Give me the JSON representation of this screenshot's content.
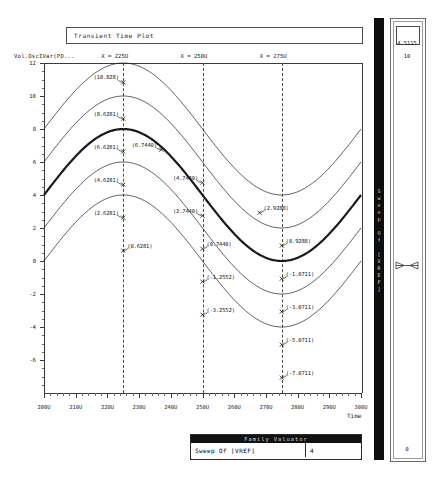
{
  "window": {
    "title": "Transient Time Plot"
  },
  "plot": {
    "y_axis_label": "Vol.OscIVar(PD...",
    "x_axis_label": "Time",
    "y_ticks": [
      "12",
      "10",
      "8",
      "6",
      "4",
      "2",
      "0",
      "-2",
      "-4",
      "-6"
    ],
    "y_values": [
      12,
      10,
      8,
      6,
      4,
      2,
      0,
      -2,
      -4,
      -6
    ],
    "x_ticks": [
      "200U",
      "210U",
      "220U",
      "230U",
      "240U",
      "250U",
      "260U",
      "270U",
      "280U",
      "290U",
      "300U"
    ],
    "x_values": [
      200,
      210,
      220,
      230,
      240,
      250,
      260,
      270,
      280,
      290,
      300
    ],
    "cursors": [
      {
        "label": "X = 225U",
        "x": 225
      },
      {
        "label": "X = 250U",
        "x": 250
      },
      {
        "label": "X = 275U",
        "x": 275
      }
    ],
    "annotations": [
      {
        "text": "(10.828)",
        "x": 225,
        "y": 10.828
      },
      {
        "text": "(8.6281)",
        "x": 225,
        "y": 8.6281
      },
      {
        "text": "(6.6281)",
        "x": 225,
        "y": 6.6281
      },
      {
        "text": "(6.7440)",
        "x": 237,
        "y": 6.744
      },
      {
        "text": "(4.6281)",
        "x": 225,
        "y": 4.6281
      },
      {
        "text": "(4.7440)",
        "x": 250,
        "y": 4.744
      },
      {
        "text": "(2.6281)",
        "x": 225,
        "y": 2.6281
      },
      {
        "text": "(2.7440)",
        "x": 250,
        "y": 2.744
      },
      {
        "text": "(2.9288)",
        "x": 268,
        "y": 2.9288
      },
      {
        "text": "(0.6281)",
        "x": 225,
        "y": 0.6281
      },
      {
        "text": "(0.7440)",
        "x": 250,
        "y": 0.744
      },
      {
        "text": "(0.9288)",
        "x": 275,
        "y": 0.9288
      },
      {
        "text": "(-1.2552)",
        "x": 250,
        "y": -1.2552
      },
      {
        "text": "(-1.0711)",
        "x": 275,
        "y": -1.0711
      },
      {
        "text": "(-3.2552)",
        "x": 250,
        "y": -3.2552
      },
      {
        "text": "(-3.0711)",
        "x": 275,
        "y": -3.0711
      },
      {
        "text": "(-5.0711)",
        "x": 275,
        "y": -5.0711
      },
      {
        "text": "(-7.0711)",
        "x": 275,
        "y": -7.0711
      }
    ]
  },
  "chart_data": {
    "type": "line",
    "title": "Transient Time Plot",
    "xlabel": "Time",
    "ylabel": "Vol.OscIVar(PD...",
    "xlim": [
      200,
      300
    ],
    "ylim": [
      -8,
      12
    ],
    "grid": false,
    "legend": "none",
    "x_tick_labels": [
      "200U",
      "210U",
      "220U",
      "230U",
      "240U",
      "250U",
      "260U",
      "270U",
      "280U",
      "290U",
      "300U"
    ],
    "y_tick_labels": [
      "12",
      "10",
      "8",
      "6",
      "4",
      "2",
      "0",
      "-2",
      "-4",
      "-6"
    ],
    "cursor_x_values": [
      225,
      250,
      275
    ],
    "series": [
      {
        "name": "VREF sweep 1",
        "offset": 8.0,
        "amplitude": 4.0,
        "emphasis": false
      },
      {
        "name": "VREF sweep 2",
        "offset": 6.0,
        "amplitude": 4.0,
        "emphasis": false
      },
      {
        "name": "VREF sweep 3",
        "offset": 4.0,
        "amplitude": 4.0,
        "emphasis": true
      },
      {
        "name": "VREF sweep 4",
        "offset": 2.0,
        "amplitude": 4.0,
        "emphasis": false
      },
      {
        "name": "VREF sweep 5",
        "offset": 0.0,
        "amplitude": 4.0,
        "emphasis": false
      }
    ],
    "annotated_points": [
      {
        "label": "(10.828)",
        "x": 225,
        "y": 10.828
      },
      {
        "label": "(8.6281)",
        "x": 225,
        "y": 8.6281
      },
      {
        "label": "(6.6281)",
        "x": 225,
        "y": 6.6281
      },
      {
        "label": "(6.7440)",
        "x": 237,
        "y": 6.744
      },
      {
        "label": "(4.6281)",
        "x": 225,
        "y": 4.6281
      },
      {
        "label": "(4.7440)",
        "x": 250,
        "y": 4.744
      },
      {
        "label": "(2.6281)",
        "x": 225,
        "y": 2.6281
      },
      {
        "label": "(2.7440)",
        "x": 250,
        "y": 2.744
      },
      {
        "label": "(2.9288)",
        "x": 268,
        "y": 2.9288
      },
      {
        "label": "(0.6281)",
        "x": 225,
        "y": 0.6281
      },
      {
        "label": "(0.7440)",
        "x": 250,
        "y": 0.744
      },
      {
        "label": "(0.9288)",
        "x": 275,
        "y": 0.9288
      },
      {
        "label": "(-1.2552)",
        "x": 250,
        "y": -1.2552
      },
      {
        "label": "(-1.0711)",
        "x": 275,
        "y": -1.0711
      },
      {
        "label": "(-3.2552)",
        "x": 250,
        "y": -3.2552
      },
      {
        "label": "(-3.0711)",
        "x": 275,
        "y": -3.0711
      },
      {
        "label": "(-5.0711)",
        "x": 275,
        "y": -5.0711
      },
      {
        "label": "(-7.0711)",
        "x": 275,
        "y": -7.0711
      }
    ]
  },
  "family_valuator": {
    "header": "Family Valuator",
    "parameter": "Sweep Of [VREF]",
    "value": "4"
  },
  "sidebar": {
    "vertical_label": "Sweep Of [VREF]",
    "top_value": "4.5115",
    "second_value": "10",
    "bottom_value": "0"
  }
}
